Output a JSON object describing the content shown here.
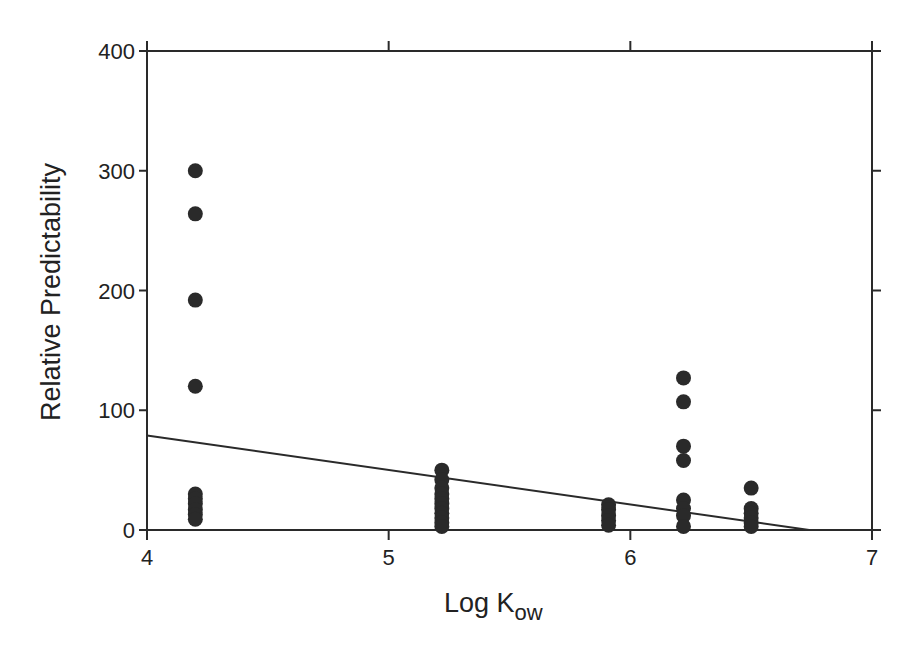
{
  "chart_data": {
    "type": "scatter",
    "title": "",
    "xlabel": "Log K",
    "xlabel_subscript": "ow",
    "ylabel": "Relative Predictability",
    "xlim": [
      4,
      7
    ],
    "ylim": [
      0,
      400
    ],
    "xticks": [
      4,
      5,
      6,
      7
    ],
    "xtick_labels": [
      "4",
      "5",
      "6",
      "7"
    ],
    "yticks": [
      0,
      100,
      200,
      300,
      400
    ],
    "ytick_labels": [
      "0",
      "100",
      "200",
      "300",
      "400"
    ],
    "grid": false,
    "legend": null,
    "marker": "filled-circle",
    "marker_color": "#2a2a2a",
    "series": [
      {
        "name": "observations",
        "points": [
          {
            "x": 4.2,
            "y": 300
          },
          {
            "x": 4.2,
            "y": 264
          },
          {
            "x": 4.2,
            "y": 192
          },
          {
            "x": 4.2,
            "y": 120
          },
          {
            "x": 4.2,
            "y": 30
          },
          {
            "x": 4.2,
            "y": 26
          },
          {
            "x": 4.2,
            "y": 22
          },
          {
            "x": 4.2,
            "y": 17
          },
          {
            "x": 4.2,
            "y": 13
          },
          {
            "x": 4.2,
            "y": 9
          },
          {
            "x": 5.22,
            "y": 50
          },
          {
            "x": 5.22,
            "y": 42
          },
          {
            "x": 5.22,
            "y": 35
          },
          {
            "x": 5.22,
            "y": 30
          },
          {
            "x": 5.22,
            "y": 26
          },
          {
            "x": 5.22,
            "y": 22
          },
          {
            "x": 5.22,
            "y": 18
          },
          {
            "x": 5.22,
            "y": 14
          },
          {
            "x": 5.22,
            "y": 10
          },
          {
            "x": 5.22,
            "y": 6
          },
          {
            "x": 5.22,
            "y": 3
          },
          {
            "x": 5.91,
            "y": 21
          },
          {
            "x": 5.91,
            "y": 17
          },
          {
            "x": 5.91,
            "y": 12
          },
          {
            "x": 5.91,
            "y": 8
          },
          {
            "x": 5.91,
            "y": 4
          },
          {
            "x": 6.22,
            "y": 127
          },
          {
            "x": 6.22,
            "y": 107
          },
          {
            "x": 6.22,
            "y": 70
          },
          {
            "x": 6.22,
            "y": 58
          },
          {
            "x": 6.22,
            "y": 25
          },
          {
            "x": 6.22,
            "y": 18
          },
          {
            "x": 6.22,
            "y": 12
          },
          {
            "x": 6.22,
            "y": 3
          },
          {
            "x": 6.5,
            "y": 35
          },
          {
            "x": 6.5,
            "y": 18
          },
          {
            "x": 6.5,
            "y": 14
          },
          {
            "x": 6.5,
            "y": 10
          },
          {
            "x": 6.5,
            "y": 6
          },
          {
            "x": 6.5,
            "y": 3
          }
        ]
      }
    ],
    "regression_line": {
      "x0": 4.0,
      "y0": 79,
      "x1": 6.74,
      "y1": 0
    }
  }
}
